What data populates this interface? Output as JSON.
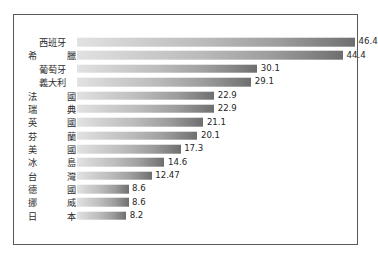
{
  "chart_data": {
    "type": "bar",
    "orientation": "horizontal",
    "title": "",
    "subtitle": "",
    "xlabel": "",
    "ylabel": "",
    "grid": false,
    "legend": false,
    "legend_position": "none",
    "axis_visible": false,
    "xlim": [
      0,
      46.4
    ],
    "value_labels_shown": true,
    "categories": [
      "西班牙",
      "希  臘",
      "葡萄牙",
      "義大利",
      "法  國",
      "瑞  典",
      "英  國",
      "芬  蘭",
      "美  國",
      "冰  島",
      "台  灣",
      "德  國",
      "挪  威",
      "日  本"
    ],
    "values": [
      46.4,
      44.4,
      30.1,
      29.1,
      22.9,
      22.9,
      21.1,
      20.1,
      17.3,
      14.6,
      12.47,
      8.6,
      8.6,
      8.2
    ],
    "value_labels": [
      "46.4",
      "44.4",
      "30.1",
      "29.1",
      "22.9",
      "22.9",
      "21.1",
      "20.1",
      "17.3",
      "14.6",
      "12.47",
      "8.6",
      "8.6",
      "8.2"
    ]
  },
  "style": {
    "frame_border_color": "#5a5a5a",
    "background_color": "#ffffff",
    "bar_gradient_start": "#e2e2e2",
    "bar_gradient_end": "#6e6e6e",
    "label_color": "#2b2b2b",
    "value_color": "#262626"
  }
}
